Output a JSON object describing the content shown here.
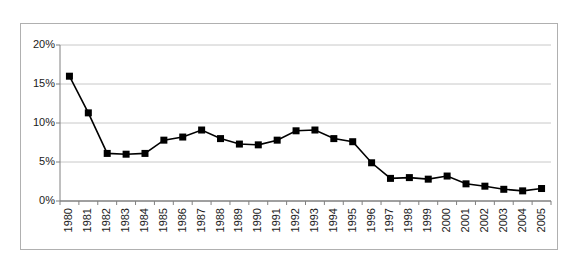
{
  "chart_data": {
    "type": "line",
    "title": "",
    "subtitle": "",
    "xlabel": "",
    "ylabel": "",
    "categories": [
      "1980",
      "1981",
      "1982",
      "1983",
      "1984",
      "1985",
      "1986",
      "1987",
      "1988",
      "1989",
      "1990",
      "1991",
      "1992",
      "1993",
      "1994",
      "1995",
      "1996",
      "1997",
      "1998",
      "1999",
      "2000",
      "2001",
      "2002",
      "2003",
      "2004",
      "2005"
    ],
    "values": [
      16.0,
      11.3,
      6.1,
      6.0,
      6.1,
      7.8,
      8.2,
      9.1,
      8.0,
      7.3,
      7.2,
      7.8,
      9.0,
      9.1,
      8.0,
      7.6,
      4.9,
      2.9,
      3.0,
      2.8,
      3.2,
      2.2,
      1.9,
      1.5,
      1.3,
      1.6
    ],
    "series": [
      {
        "name": "",
        "values": [
          16.0,
          11.3,
          6.1,
          6.0,
          6.1,
          7.8,
          8.2,
          9.1,
          8.0,
          7.3,
          7.2,
          7.8,
          9.0,
          9.1,
          8.0,
          7.6,
          4.9,
          2.9,
          3.0,
          2.8,
          3.2,
          2.2,
          1.9,
          1.5,
          1.3,
          1.6
        ],
        "marker": "square",
        "color": "#000000"
      }
    ],
    "ylim": [
      0,
      20
    ],
    "yticks": [
      0,
      5,
      10,
      15,
      20
    ],
    "ytick_labels": [
      "0%",
      "5%",
      "10%",
      "15%",
      "20%"
    ],
    "xtick_labels": [
      "1980",
      "1981",
      "1982",
      "1983",
      "1984",
      "1985",
      "1986",
      "1987",
      "1988",
      "1989",
      "1990",
      "1991",
      "1992",
      "1993",
      "1994",
      "1995",
      "1996",
      "1997",
      "1998",
      "1999",
      "2000",
      "2001",
      "2002",
      "2003",
      "2004",
      "2005"
    ],
    "grid": "horizontal",
    "legend": "none",
    "annotations": [],
    "colors": {
      "line": "#000000",
      "marker": "#000000",
      "gridline": "#c8c8c8",
      "axis": "#808080",
      "frame": "#b0b0b0",
      "background": "#ffffff",
      "text": "#1a1a1a"
    }
  }
}
